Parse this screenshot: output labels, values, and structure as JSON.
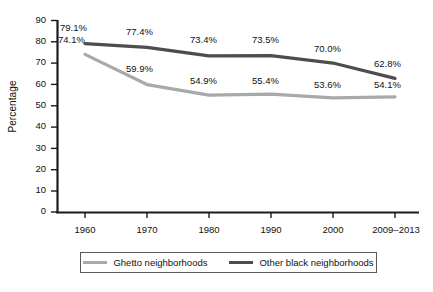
{
  "chart_data": {
    "type": "line",
    "title": "",
    "xlabel": "",
    "ylabel": "Percentage",
    "categories": [
      "1960",
      "1970",
      "1980",
      "1990",
      "2000",
      "2009–2013"
    ],
    "ylim": [
      0,
      90
    ],
    "yticks": [
      "0",
      "10",
      "20",
      "30",
      "40",
      "50",
      "60",
      "70",
      "80",
      "90"
    ],
    "grid": false,
    "legend_position": "bottom",
    "series": [
      {
        "name": "Ghetto neighborhoods",
        "color": "#a9a9a9",
        "values": [
          74.1,
          59.9,
          54.9,
          55.4,
          53.6,
          54.1
        ],
        "labels": [
          "74.1%",
          "59.9%",
          "54.9%",
          "55.4%",
          "53.6%",
          "54.1%"
        ]
      },
      {
        "name": "Other black neighborhoods",
        "color": "#4d4d4d",
        "values": [
          79.1,
          77.4,
          73.4,
          73.5,
          70.0,
          62.8
        ],
        "labels": [
          "79.1%",
          "77.4%",
          "73.4%",
          "73.5%",
          "70.0%",
          "62.8%"
        ]
      }
    ]
  },
  "axis": {
    "y_label": "Percentage",
    "y_ticks": [
      "90",
      "80",
      "70",
      "60",
      "50",
      "40",
      "30",
      "20",
      "10",
      "0"
    ],
    "x_ticks": [
      "1960",
      "1970",
      "1980",
      "1990",
      "2000",
      "2009–2013"
    ],
    "axis_color": "#1a1a1a"
  },
  "labels": {
    "ghetto": [
      "74.1%",
      "59.9%",
      "54.9%",
      "55.4%",
      "53.6%",
      "54.1%"
    ],
    "other": [
      "79.1%",
      "77.4%",
      "73.4%",
      "73.5%",
      "70.0%",
      "62.8%"
    ]
  },
  "legend": {
    "items": [
      {
        "label": "Ghetto neighborhoods",
        "color": "#a9a9a9"
      },
      {
        "label": "Other black neighborhoods",
        "color": "#4d4d4d"
      }
    ]
  }
}
